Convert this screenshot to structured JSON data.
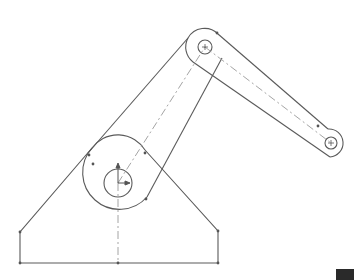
{
  "drawing": {
    "type": "cad-sketch",
    "subject": "two-link arm on triangular base",
    "colors": {
      "background": "#ffffff",
      "line": "#555555",
      "centerline": "#9a9a9a",
      "point": "#555555",
      "corner_block": "#2a2a2a"
    },
    "base": {
      "polygon": [
        [
          20,
          263
        ],
        [
          218,
          263
        ],
        [
          218,
          231
        ],
        [
          145,
          150
        ],
        [
          92,
          148
        ],
        [
          20,
          232
        ]
      ],
      "bottom_midpoint": [
        118,
        263
      ]
    },
    "joints": [
      {
        "name": "base-pivot",
        "cx": 118,
        "cy": 183,
        "outer_r": 32,
        "inner_r": 14
      },
      {
        "name": "elbow",
        "cx": 205,
        "cy": 47,
        "outer_r": 19,
        "inner_r": 7
      },
      {
        "name": "end",
        "cx": 331,
        "cy": 143,
        "outer_r": 14,
        "inner_r": 6
      }
    ],
    "origin_marker": {
      "x": 118,
      "y": 183
    }
  }
}
